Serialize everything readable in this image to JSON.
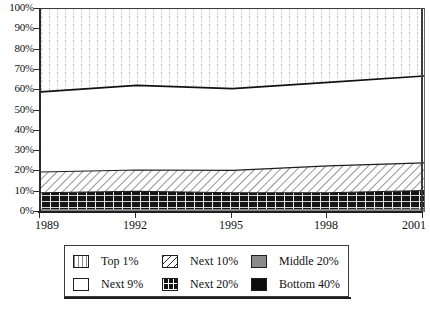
{
  "chart_data": {
    "type": "area",
    "stacked": true,
    "title": "",
    "subtitle": "",
    "xlabel": "",
    "ylabel": "",
    "x": [
      1989,
      1992,
      1995,
      1998,
      2001
    ],
    "xlim": [
      1989,
      2001
    ],
    "ylim": [
      0,
      100
    ],
    "xtick_labels": [
      "1989",
      "1992",
      "1995",
      "1998",
      "2001"
    ],
    "ytick_labels": [
      "0%",
      "10%",
      "20%",
      "30%",
      "40%",
      "50%",
      "60%",
      "70%",
      "80%",
      "90%",
      "100%"
    ],
    "ytick_values": [
      0,
      10,
      20,
      30,
      40,
      50,
      60,
      70,
      80,
      90,
      100
    ],
    "grid": "vertical-dotted-in-top-band",
    "legend_position": "below-axes",
    "series": [
      {
        "name": "Top 1%",
        "pattern": "vertical-dotted",
        "color": "#ffffff",
        "values": [
          40.8,
          37.6,
          39.2,
          36.1,
          33.0
        ]
      },
      {
        "name": "Next 9%",
        "pattern": "solid-white",
        "color": "#ffffff",
        "values": [
          39.5,
          41.7,
          40.3,
          41.2,
          42.8
        ]
      },
      {
        "name": "Next 10%",
        "pattern": "diagonal-hatch",
        "color": "#ffffff",
        "values": [
          10.2,
          10.5,
          11.0,
          13.2,
          13.6
        ]
      },
      {
        "name": "Next 20%",
        "pattern": "cross-hatch",
        "color": "#141414",
        "values": [
          8.0,
          8.8,
          8.0,
          8.0,
          9.0
        ]
      },
      {
        "name": "Middle 20%",
        "pattern": "solid-gray",
        "color": "#8a8a8a",
        "values": [
          1.2,
          1.1,
          1.2,
          1.2,
          1.3
        ]
      },
      {
        "name": "Bottom 40%",
        "pattern": "solid-black",
        "color": "#0d0d0d",
        "values": [
          0.3,
          0.3,
          0.3,
          0.3,
          0.3
        ]
      }
    ],
    "cumulative_top_boundaries": {
      "note": "cumulative % from bottom, top of each band at each x",
      "bottom40": [
        0.3,
        0.3,
        0.3,
        0.3,
        0.3
      ],
      "middle20": [
        1.5,
        1.4,
        1.5,
        1.5,
        1.6
      ],
      "next20": [
        9.5,
        10.2,
        9.5,
        9.5,
        10.6
      ],
      "next10": [
        19.7,
        20.7,
        20.5,
        22.7,
        24.2
      ],
      "next9": [
        59.2,
        62.4,
        60.8,
        63.9,
        67.0
      ],
      "top1": [
        100,
        100,
        100,
        100,
        100
      ]
    }
  },
  "legend": {
    "rows": [
      [
        {
          "label": "Top 1%",
          "swatch": "sw-top1"
        },
        {
          "label": "Next 10%",
          "swatch": "sw-next10"
        },
        {
          "label": "Middle 20%",
          "swatch": "sw-mid20"
        }
      ],
      [
        {
          "label": "Next 9%",
          "swatch": "sw-next9"
        },
        {
          "label": "Next 20%",
          "swatch": "sw-next20"
        },
        {
          "label": "Bottom 40%",
          "swatch": "sw-bot40"
        }
      ]
    ]
  },
  "colors": {
    "axis": "#1d1d1d",
    "band_gray": "#8a8a8a",
    "band_black": "#0d0d0d",
    "grid_dotted": "#b9b9b9",
    "text": "#111111"
  }
}
